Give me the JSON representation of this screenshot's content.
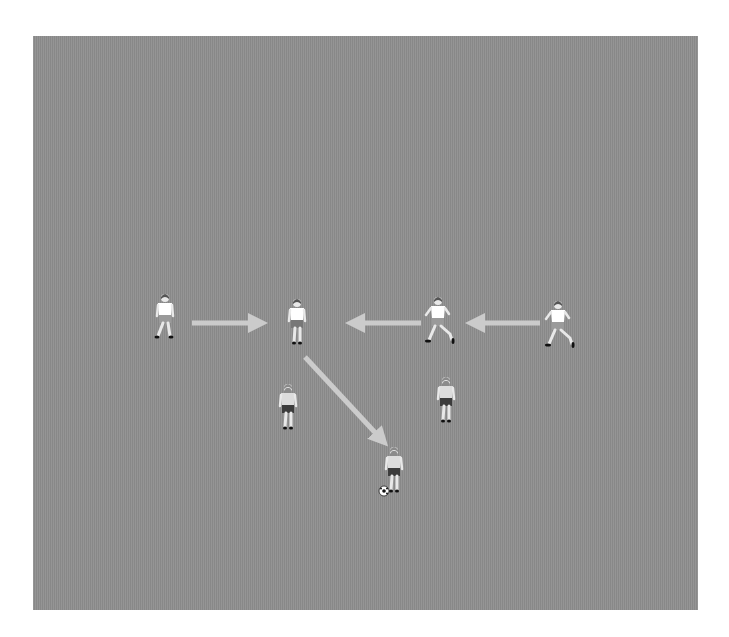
{
  "diagram": {
    "type": "soccer-drill",
    "field": {
      "color": "#8f8f8f",
      "x": 33,
      "y": 36,
      "width": 665,
      "height": 574
    },
    "arrow_color": "#cbcbcb",
    "players": [
      {
        "id": "p1",
        "x": 165,
        "y": 315,
        "pose": "walking",
        "jersey": "#ffffff",
        "shorts": "#9a9a9a",
        "label": "Player 1"
      },
      {
        "id": "p2",
        "x": 297,
        "y": 320,
        "pose": "standing",
        "jersey": "#ffffff",
        "shorts": "#777777",
        "label": "Player 2"
      },
      {
        "id": "p3",
        "x": 438,
        "y": 318,
        "pose": "running-left",
        "jersey": "#ffffff",
        "shorts": "#9a9a9a",
        "label": "Player 3"
      },
      {
        "id": "p4",
        "x": 558,
        "y": 322,
        "pose": "running-left",
        "jersey": "#ffffff",
        "shorts": "#9a9a9a",
        "label": "Player 4"
      },
      {
        "id": "p5",
        "x": 288,
        "y": 405,
        "pose": "back-view",
        "jersey": "#dcdcdc",
        "shorts": "#3c3c3c",
        "label": "Player 5"
      },
      {
        "id": "p6",
        "x": 446,
        "y": 398,
        "pose": "back-view",
        "jersey": "#dcdcdc",
        "shorts": "#3c3c3c",
        "label": "Player 6"
      },
      {
        "id": "p7",
        "x": 394,
        "y": 468,
        "pose": "back-view-dribbling",
        "jersey": "#dcdcdc",
        "shorts": "#3c3c3c",
        "label": "Player 7 (with ball)"
      }
    ],
    "arrows": [
      {
        "id": "a1",
        "from": [
          192,
          323
        ],
        "to": [
          259,
          323
        ],
        "direction": "right"
      },
      {
        "id": "a2",
        "from": [
          421,
          323
        ],
        "to": [
          354,
          323
        ],
        "direction": "left"
      },
      {
        "id": "a3",
        "from": [
          540,
          323
        ],
        "to": [
          474,
          323
        ],
        "direction": "left"
      },
      {
        "id": "a4",
        "from": [
          305,
          357
        ],
        "to": [
          382,
          440
        ],
        "direction": "down-right"
      }
    ],
    "ball": {
      "x": 384,
      "y": 491
    }
  }
}
